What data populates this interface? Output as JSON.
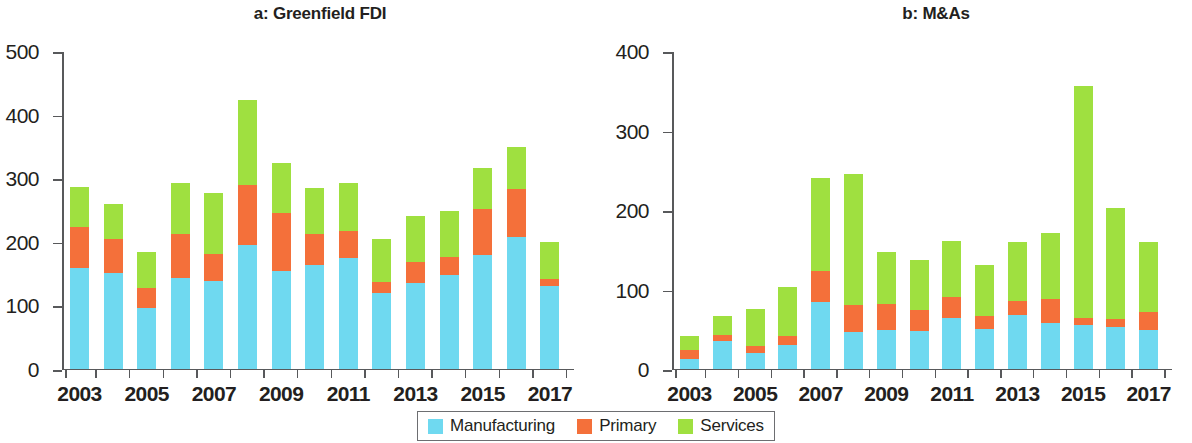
{
  "chart_data": [
    {
      "type": "bar",
      "id": "greenfield-fdi",
      "title": "a: Greenfield FDI",
      "xlabel": "",
      "ylabel": "",
      "ylim": [
        0,
        500
      ],
      "yticks": [
        0,
        100,
        200,
        300,
        400,
        500
      ],
      "grid": false,
      "stacked": true,
      "legend_position": "bottom-center-shared",
      "categories": [
        "2003",
        "2004",
        "2005",
        "2006",
        "2007",
        "2008",
        "2009",
        "2010",
        "2011",
        "2012",
        "2013",
        "2014",
        "2015",
        "2016",
        "2017"
      ],
      "xtick_labels": [
        "2003",
        "",
        "2005",
        "",
        "2007",
        "",
        "2009",
        "",
        "2011",
        "",
        "2013",
        "",
        "2015",
        "",
        "2017"
      ],
      "series": [
        {
          "name": "Manufacturing",
          "color": "#6fd9f0",
          "values": [
            158,
            150,
            95,
            142,
            138,
            194,
            154,
            163,
            174,
            119,
            134,
            147,
            179,
            206,
            129
          ]
        },
        {
          "name": "Primary",
          "color": "#f4703a",
          "values": [
            64,
            53,
            32,
            70,
            42,
            95,
            90,
            48,
            42,
            17,
            34,
            28,
            72,
            77,
            12
          ]
        },
        {
          "name": "Services",
          "color": "#9fe040",
          "values": [
            64,
            56,
            56,
            79,
            96,
            133,
            79,
            73,
            75,
            67,
            72,
            73,
            64,
            65,
            58
          ]
        }
      ],
      "totals": [
        286,
        259,
        183,
        291,
        276,
        422,
        323,
        284,
        291,
        203,
        240,
        248,
        315,
        348,
        199
      ]
    },
    {
      "type": "bar",
      "id": "m-and-as",
      "title": "b: M&As",
      "xlabel": "",
      "ylabel": "",
      "ylim": [
        0,
        400
      ],
      "yticks": [
        0,
        100,
        200,
        300,
        400
      ],
      "grid": false,
      "stacked": true,
      "legend_position": "bottom-center-shared",
      "categories": [
        "2003",
        "2004",
        "2005",
        "2006",
        "2007",
        "2008",
        "2009",
        "2010",
        "2011",
        "2012",
        "2013",
        "2014",
        "2015",
        "2016",
        "2017"
      ],
      "xtick_labels": [
        "2003",
        "",
        "2005",
        "",
        "2007",
        "",
        "2009",
        "",
        "2011",
        "",
        "2013",
        "",
        "2015",
        "",
        "2017"
      ],
      "series": [
        {
          "name": "Manufacturing",
          "color": "#6fd9f0",
          "values": [
            12,
            35,
            20,
            29,
            84,
            46,
            49,
            47,
            63,
            50,
            67,
            57,
            55,
            52,
            49
          ]
        },
        {
          "name": "Primary",
          "color": "#f4703a",
          "values": [
            11,
            7,
            8,
            12,
            39,
            34,
            32,
            26,
            27,
            16,
            18,
            30,
            9,
            10,
            22
          ]
        },
        {
          "name": "Services",
          "color": "#9fe040",
          "values": [
            18,
            24,
            47,
            62,
            117,
            165,
            66,
            64,
            70,
            64,
            74,
            84,
            291,
            140,
            88
          ]
        }
      ],
      "totals": [
        41,
        66,
        75,
        103,
        240,
        245,
        147,
        137,
        160,
        130,
        159,
        171,
        355,
        202,
        159
      ]
    }
  ],
  "legend": {
    "items": [
      {
        "label": "Manufacturing",
        "color": "#6fd9f0"
      },
      {
        "label": "Primary",
        "color": "#f4703a"
      },
      {
        "label": "Services",
        "color": "#9fe040"
      }
    ]
  }
}
